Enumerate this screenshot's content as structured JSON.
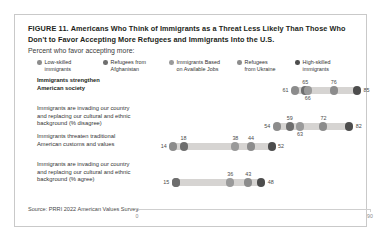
{
  "figure": {
    "number_label": "FIGURE 11.",
    "title": "Americans Who Think of Immigrants as a Threat Less Likely Than Those Who Don't to Favor Accepting More Refugees and Immigrants Into the U.S.",
    "subtitle": "Percent who favor accepting more:",
    "source": "Source: PRRI 2022 American Values Survey."
  },
  "chart_data": {
    "type": "scatter",
    "title": "Americans Who Think of Immigrants as a Threat Less Likely Than Those Who Don't to Favor Accepting More Refugees and Immigrants Into the U.S.",
    "subtitle": "Percent who favor accepting more:",
    "xlabel": "",
    "ylabel": "",
    "xlim": [
      0,
      90
    ],
    "xticks": [
      0,
      90
    ],
    "xtick_labels": [
      "0",
      "90"
    ],
    "grid": false,
    "legend_position": "top",
    "orientation": "horizontal",
    "categories": [
      "Immigrants strengthen\nAmerican society",
      "Immigrants are invading our country\nand replacing our cultural and ethnic\nbackground (% disagree)",
      "Immigrants threaten traditional\nAmerican customs and values",
      "Immigrants are invading our country\nand replacing our cultural and ethnic\nbackground (% agree)"
    ],
    "series": [
      {
        "name": "Low-skilled\nimmigrants",
        "color": "#8c8c8c",
        "values": [
          61,
          54,
          14,
          15
        ]
      },
      {
        "name": "Refugees from\nAfghanistan",
        "color": "#6e6e6e",
        "values": [
          65,
          59,
          18,
          15
        ]
      },
      {
        "name": "Immigrants Based\non Available Jobs",
        "color": "#9a9a9a",
        "values": [
          66,
          63,
          38,
          36
        ]
      },
      {
        "name": "Refugees\nfrom Ukraine",
        "color": "#8c8c8c",
        "values": [
          76,
          72,
          44,
          43
        ]
      },
      {
        "name": "High-skilled\nimmigrants",
        "color": "#4d4d4d",
        "values": [
          85,
          82,
          52,
          48
        ]
      }
    ],
    "rows": [
      {
        "label": "Immigrants strengthen\nAmerican society",
        "bold": true,
        "min": 61,
        "max": 85,
        "points": [
          {
            "value": 61,
            "color": "#8c8c8c",
            "label": "61",
            "label_pos": "left"
          },
          {
            "value": 65,
            "color": "#6e6e6e",
            "label": "65",
            "label_pos": "above"
          },
          {
            "value": 66,
            "color": "#9a9a9a",
            "label": "66",
            "label_pos": "below"
          },
          {
            "value": 76,
            "color": "#8c8c8c",
            "label": "76",
            "label_pos": "above"
          },
          {
            "value": 85,
            "color": "#4d4d4d",
            "label": "85",
            "label_pos": "right"
          }
        ]
      },
      {
        "label": "Immigrants are invading our country\nand replacing our cultural and ethnic\nbackground (% disagree)",
        "bold": false,
        "min": 54,
        "max": 82,
        "points": [
          {
            "value": 54,
            "color": "#8c8c8c",
            "label": "54",
            "label_pos": "left"
          },
          {
            "value": 59,
            "color": "#6e6e6e",
            "label": "59",
            "label_pos": "above"
          },
          {
            "value": 63,
            "color": "#9a9a9a",
            "label": "63",
            "label_pos": "below"
          },
          {
            "value": 72,
            "color": "#8c8c8c",
            "label": "72",
            "label_pos": "above"
          },
          {
            "value": 82,
            "color": "#4d4d4d",
            "label": "82",
            "label_pos": "right"
          }
        ]
      },
      {
        "label": "Immigrants threaten traditional\nAmerican customs and values",
        "bold": false,
        "min": 14,
        "max": 52,
        "points": [
          {
            "value": 14,
            "color": "#8c8c8c",
            "label": "14",
            "label_pos": "left"
          },
          {
            "value": 18,
            "color": "#6e6e6e",
            "label": "18",
            "label_pos": "above"
          },
          {
            "value": 38,
            "color": "#9a9a9a",
            "label": "38",
            "label_pos": "above"
          },
          {
            "value": 44,
            "color": "#8c8c8c",
            "label": "44",
            "label_pos": "above"
          },
          {
            "value": 52,
            "color": "#4d4d4d",
            "label": "52",
            "label_pos": "right"
          }
        ]
      },
      {
        "label": "Immigrants are invading our country\nand replacing our cultural and ethnic\nbackground (% agree)",
        "bold": false,
        "min": 15,
        "max": 48,
        "points": [
          {
            "value": 15,
            "color": "#8c8c8c",
            "label": "15",
            "label_pos": "left"
          },
          {
            "value": 15,
            "color": "#6e6e6e",
            "label": "",
            "label_pos": "none"
          },
          {
            "value": 36,
            "color": "#9a9a9a",
            "label": "36",
            "label_pos": "above"
          },
          {
            "value": 43,
            "color": "#8c8c8c",
            "label": "43",
            "label_pos": "above"
          },
          {
            "value": 48,
            "color": "#4d4d4d",
            "label": "48",
            "label_pos": "right"
          }
        ]
      }
    ]
  },
  "legend": [
    {
      "label": "Low-skilled\nimmigrants",
      "color": "#8c8c8c"
    },
    {
      "label": "Refugees from\nAfghanistan",
      "color": "#6e6e6e"
    },
    {
      "label": "Immigrants Based\non Available Jobs",
      "color": "#9a9a9a"
    },
    {
      "label": "Refugees\nfrom Ukraine",
      "color": "#8c8c8c"
    },
    {
      "label": "High-skilled\nimmigrants",
      "color": "#4d4d4d"
    }
  ],
  "axis": {
    "min_label": "0",
    "max_label": "90"
  }
}
